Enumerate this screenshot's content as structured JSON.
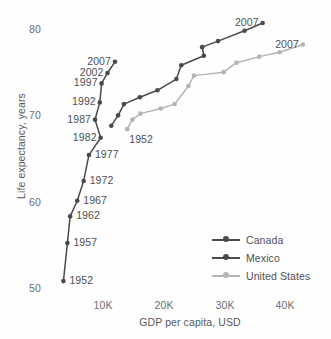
{
  "chart_data": {
    "type": "line",
    "title": "",
    "subtitle": "",
    "xlabel": "GDP per capita, USD",
    "ylabel": "Life expectancy, years",
    "xlim": [
      1500,
      46000
    ],
    "ylim": [
      49.0,
      81.5
    ],
    "xticks": [
      10000,
      20000,
      30000,
      40000
    ],
    "xtick_labels": [
      "10K",
      "20K",
      "30K",
      "40K"
    ],
    "yticks": [
      50,
      60,
      70,
      80
    ],
    "ytick_labels": [
      "50",
      "60",
      "70",
      "80"
    ],
    "grid": false,
    "legend_position": "lower right",
    "x_key": "gdp_per_capita_usd",
    "y_key": "life_expectancy_years",
    "point_years": [
      1952,
      1957,
      1962,
      1967,
      1972,
      1977,
      1982,
      1987,
      1992,
      1997,
      2002,
      2007
    ],
    "series": [
      {
        "name": "Canada",
        "color": "#4a4a4c",
        "x": [
          11367,
          12490,
          13462,
          16077,
          18971,
          22091,
          22899,
          26627,
          26343,
          28955,
          33329,
          36319
        ],
        "y": [
          68.8,
          70.0,
          71.3,
          72.1,
          72.9,
          74.2,
          75.8,
          76.9,
          77.9,
          78.6,
          79.8,
          80.7
        ],
        "labels": [
          {
            "year": 2007,
            "text": "2007",
            "position": "left"
          }
        ]
      },
      {
        "name": "Mexico",
        "color": "#4a4a4c",
        "x": [
          3478,
          4132,
          4582,
          5755,
          6809,
          7674,
          9611,
          8688,
          9472,
          9767,
          10742,
          11978
        ],
        "y": [
          50.8,
          55.2,
          58.3,
          60.1,
          62.4,
          65.4,
          67.4,
          69.5,
          71.5,
          73.7,
          74.9,
          76.2
        ],
        "labels": [
          {
            "year": 1952,
            "text": "1952",
            "position": "right"
          },
          {
            "year": 1957,
            "text": "1957",
            "position": "right"
          },
          {
            "year": 1962,
            "text": "1962",
            "position": "right"
          },
          {
            "year": 1967,
            "text": "1967",
            "position": "right"
          },
          {
            "year": 1972,
            "text": "1972",
            "position": "right"
          },
          {
            "year": 1977,
            "text": "1977",
            "position": "right"
          },
          {
            "year": 1982,
            "text": "1982",
            "position": "left"
          },
          {
            "year": 1987,
            "text": "1987",
            "position": "left"
          },
          {
            "year": 1992,
            "text": "1992",
            "position": "left"
          },
          {
            "year": 1997,
            "text": "1997",
            "position": "left"
          },
          {
            "year": 2002,
            "text": "2002",
            "position": "left"
          },
          {
            "year": 2007,
            "text": "2007",
            "position": "left"
          }
        ]
      },
      {
        "name": "United States",
        "color": "#b4b4b4",
        "x": [
          13990,
          14847,
          16173,
          19530,
          21806,
          24072,
          25010,
          29884,
          32004,
          35767,
          39097,
          42952
        ],
        "y": [
          68.4,
          69.5,
          70.2,
          70.8,
          71.3,
          73.4,
          74.6,
          75.0,
          76.1,
          76.8,
          77.3,
          78.2
        ],
        "labels": [
          {
            "year": 1952,
            "text": "1952",
            "position": "below-right"
          },
          {
            "year": 2007,
            "text": "2007",
            "position": "left"
          }
        ]
      }
    ]
  },
  "legend": {
    "items": [
      {
        "label": "Canada",
        "color": "#4a4a4c"
      },
      {
        "label": "Mexico",
        "color": "#4a4a4c"
      },
      {
        "label": "United States",
        "color": "#b4b4b4"
      }
    ]
  }
}
